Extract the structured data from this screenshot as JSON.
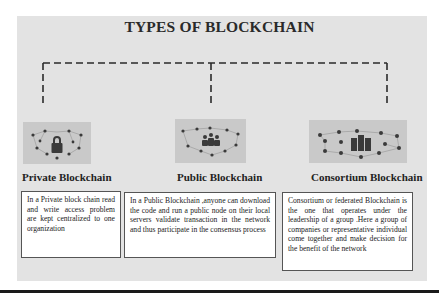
{
  "title": "TYPES OF BLOCKCHAIN",
  "types": [
    {
      "icon": "network-lock-icon",
      "label": "Private Blockchain",
      "description": "In a Private block chain read and write access problem are kept centralized to one organization"
    },
    {
      "icon": "network-users-icon",
      "label": "Public Blockchain",
      "description": "In a Public Blockchain ,anyone can download the code and run a public node on their local servers validate transaction in the network and thus participate in the consensus process"
    },
    {
      "icon": "network-buildings-icon",
      "label": "Consortium Blockchain",
      "description": "Consortium or federated Blockchain is the one that operates under the leadership of a group .Here a group of companies or representative individual come together and make decision for the benefit of the network"
    }
  ],
  "colors": {
    "panel_bg": "#e3e3e3",
    "thumb_bg": "#c9c9c9",
    "node": "#3a3a3a",
    "line": "#2b2b2b"
  }
}
